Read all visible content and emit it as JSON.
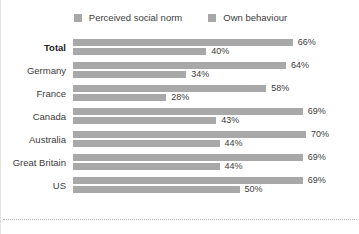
{
  "legend": {
    "items": [
      {
        "label": "Perceived social norm",
        "key": "perceived_social_norm",
        "color": "#a8a8a8"
      },
      {
        "label": "Own behaviour",
        "key": "own_behaviour",
        "color": "#a8a8a8"
      }
    ]
  },
  "chart_data": {
    "type": "bar",
    "orientation": "horizontal",
    "title": "",
    "subtitle": "",
    "xlabel": "",
    "ylabel": "",
    "xlim": [
      0,
      70
    ],
    "grid": false,
    "legend_position": "top-center",
    "value_suffix": "%",
    "categories": [
      "Total",
      "Germany",
      "France",
      "Canada",
      "Australia",
      "Great Britain",
      "US"
    ],
    "emphasized_categories": [
      "Total"
    ],
    "series": [
      {
        "name": "Perceived social norm",
        "color": "#a8a8a8",
        "values": [
          66,
          64,
          58,
          69,
          70,
          69,
          69
        ],
        "labels": [
          "66%",
          "64%",
          "58%",
          "69%",
          "70%",
          "69%",
          "69%"
        ]
      },
      {
        "name": "Own behaviour",
        "color": "#a8a8a8",
        "values": [
          40,
          34,
          28,
          43,
          44,
          44,
          50
        ],
        "labels": [
          "40%",
          "34%",
          "28%",
          "43%",
          "44%",
          "44%",
          "50%"
        ]
      }
    ]
  }
}
